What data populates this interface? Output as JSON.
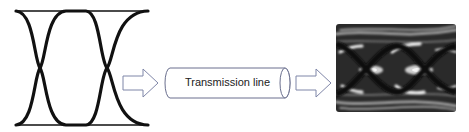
{
  "diagram": {
    "title": "",
    "nodes": [
      {
        "id": "input-eye",
        "type": "eye-diagram",
        "label": "",
        "state": "clean"
      },
      {
        "id": "transmission-line",
        "type": "cylinder",
        "label": "Transmission line"
      },
      {
        "id": "output-eye",
        "type": "eye-diagram",
        "label": "",
        "state": "degraded/noisy"
      }
    ],
    "edges": [
      {
        "from": "input-eye",
        "to": "transmission-line",
        "style": "hollow-arrow"
      },
      {
        "from": "transmission-line",
        "to": "output-eye",
        "style": "hollow-arrow"
      }
    ],
    "transmission_line_label": "Transmission line",
    "colors": {
      "eye_stroke": "#111111",
      "arrow_stroke": "#7f86a8",
      "cylinder_stroke": "#6a6f8e",
      "background": "#ffffff"
    }
  }
}
